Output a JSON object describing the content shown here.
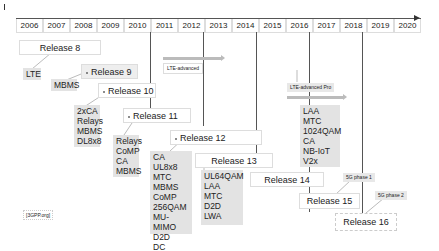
{
  "timeline": {
    "years": [
      "2006",
      "2007",
      "2008",
      "2009",
      "2010",
      "2011",
      "2012",
      "2013",
      "2014",
      "2015",
      "2016",
      "2017",
      "2018",
      "2019",
      "2020"
    ]
  },
  "phases": {
    "lte_advanced": "LTE-advanced",
    "lte_advanced_pro": "LTE-advanced Pro",
    "fiveg_phase1": "5G phase 1",
    "fiveg_phase2": "5G phase 2"
  },
  "releases": [
    {
      "label": "Release 8",
      "features": [
        "LTE"
      ]
    },
    {
      "label": "Release 9",
      "features": [
        "MBMS"
      ]
    },
    {
      "label": "Release 10",
      "features": [
        "2xCA",
        "Relays",
        "MBMS",
        "DL8x8"
      ]
    },
    {
      "label": "Release 11",
      "features": [
        "Relays",
        "CoMP",
        "CA",
        "MBMS"
      ]
    },
    {
      "label": "Release 12",
      "features": [
        "CA",
        "UL8x8",
        "MTC",
        "MBMS",
        "CoMP",
        "256QAM",
        "MU-MIMO",
        "D2D",
        "DC"
      ]
    },
    {
      "label": "Release 13",
      "features": [
        "UL64QAM",
        "LAA",
        "MTC",
        "D2D",
        "LWA"
      ]
    },
    {
      "label": "Release 14",
      "features": [
        "LAA",
        "MTC",
        "1024QAM",
        "CA",
        "NB-IoT",
        "V2x"
      ]
    },
    {
      "label": "Release 15",
      "features": []
    },
    {
      "label": "Release 16",
      "features": []
    }
  ],
  "source": "[3GPP.org]"
}
